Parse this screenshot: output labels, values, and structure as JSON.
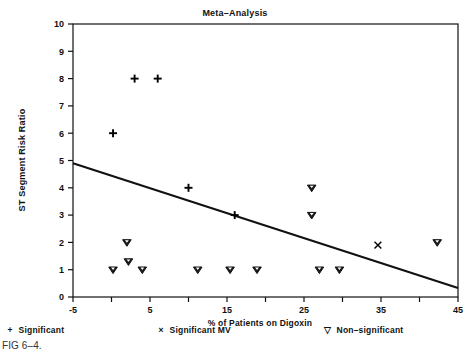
{
  "figure": {
    "caption": "FIG 6–4."
  },
  "legend": {
    "position": "below-axis",
    "items": [
      {
        "symbol": "+",
        "label": "Significant",
        "name": "legend-significant"
      },
      {
        "symbol": "×",
        "label": "Significant MV",
        "name": "legend-significant-mv"
      },
      {
        "symbol": "▽",
        "label": "Non–significant",
        "name": "legend-non-significant"
      }
    ]
  },
  "chart_data": {
    "type": "scatter",
    "title": "Meta–Analysis",
    "xlabel": "% of Patients on Digoxin",
    "ylabel": "ST Segment Risk Ratio",
    "xlim": [
      -5,
      45
    ],
    "ylim": [
      0,
      10
    ],
    "xticks": [
      -5,
      0,
      5,
      10,
      15,
      20,
      25,
      30,
      35,
      40,
      45
    ],
    "xtick_labels": [
      "-5",
      "",
      "5",
      "",
      "15",
      "",
      "25",
      "",
      "35",
      "",
      "45"
    ],
    "yticks": [
      0,
      1,
      2,
      3,
      4,
      5,
      6,
      7,
      8,
      9,
      10
    ],
    "ytick_labels": [
      "0",
      "1",
      "2",
      "3",
      "4",
      "5",
      "6",
      "7",
      "8",
      "9",
      "10"
    ],
    "grid": false,
    "series": [
      {
        "name": "Significant",
        "marker": "plus",
        "color": "#000000",
        "points": [
          {
            "x": 0.2,
            "y": 6.0
          },
          {
            "x": 3.0,
            "y": 8.0
          },
          {
            "x": 6.0,
            "y": 8.0
          },
          {
            "x": 10.0,
            "y": 4.0
          },
          {
            "x": 16.0,
            "y": 3.0
          }
        ]
      },
      {
        "name": "Significant MV",
        "marker": "cross",
        "color": "#000000",
        "points": [
          {
            "x": 34.6,
            "y": 1.9
          }
        ]
      },
      {
        "name": "Non-significant",
        "marker": "triangle-down",
        "color": "#000000",
        "points": [
          {
            "x": 0.2,
            "y": 1.0
          },
          {
            "x": 2.0,
            "y": 2.0
          },
          {
            "x": 2.2,
            "y": 1.3
          },
          {
            "x": 4.0,
            "y": 1.0
          },
          {
            "x": 11.2,
            "y": 1.0
          },
          {
            "x": 15.4,
            "y": 1.0
          },
          {
            "x": 18.9,
            "y": 1.0
          },
          {
            "x": 26.0,
            "y": 4.0
          },
          {
            "x": 26.0,
            "y": 3.0
          },
          {
            "x": 27.0,
            "y": 1.0
          },
          {
            "x": 29.6,
            "y": 1.0
          },
          {
            "x": 42.3,
            "y": 2.0
          }
        ]
      }
    ],
    "fit_line": {
      "name": "regression-line",
      "x_start": -5,
      "y_start": 4.9,
      "x_end": 45,
      "y_end": 0.33
    }
  }
}
